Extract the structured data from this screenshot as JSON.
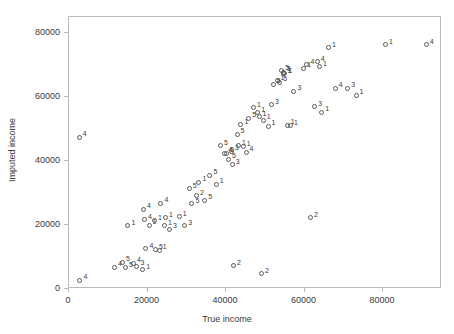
{
  "chart_data": {
    "type": "scatter",
    "title": "",
    "xlabel": "True income",
    "ylabel": "Imputed income",
    "xlim": [
      0,
      95000
    ],
    "ylim": [
      0,
      85000
    ],
    "xticks": [
      0,
      20000,
      40000,
      60000,
      80000
    ],
    "xtick_labels": [
      "0",
      "20000",
      "40000",
      "60000",
      "80000"
    ],
    "yticks": [
      0,
      20000,
      40000,
      60000,
      80000
    ],
    "ytick_labels": [
      "0",
      "20000",
      "40000",
      "60000",
      "80000"
    ],
    "grid": false,
    "legend": false,
    "marker": "open-circle",
    "point_label_note": "each point is annotated with an imputation/group number",
    "points": [
      {
        "x": 2600,
        "y": 47500,
        "label": "4"
      },
      {
        "x": 2800,
        "y": 2700,
        "label": "4"
      },
      {
        "x": 11600,
        "y": 6800,
        "label": "4"
      },
      {
        "x": 13600,
        "y": 8300,
        "label": "5"
      },
      {
        "x": 14400,
        "y": 6600,
        "label": "5"
      },
      {
        "x": 15000,
        "y": 19800,
        "label": "1"
      },
      {
        "x": 16400,
        "y": 8000,
        "label": "4"
      },
      {
        "x": 17300,
        "y": 7100,
        "label": "3"
      },
      {
        "x": 18800,
        "y": 6000,
        "label": "1"
      },
      {
        "x": 19000,
        "y": 25000,
        "label": "4"
      },
      {
        "x": 19200,
        "y": 21700,
        "label": "4"
      },
      {
        "x": 19600,
        "y": 12600,
        "label": "4"
      },
      {
        "x": 20400,
        "y": 19900,
        "label": "1"
      },
      {
        "x": 21800,
        "y": 21400,
        "label": "1"
      },
      {
        "x": 22000,
        "y": 12200,
        "label": "5"
      },
      {
        "x": 23000,
        "y": 12100,
        "label": "1"
      },
      {
        "x": 23400,
        "y": 26800,
        "label": "4"
      },
      {
        "x": 24300,
        "y": 19800,
        "label": "1"
      },
      {
        "x": 24600,
        "y": 22200,
        "label": "1"
      },
      {
        "x": 25600,
        "y": 18600,
        "label": "3"
      },
      {
        "x": 28100,
        "y": 22600,
        "label": "1"
      },
      {
        "x": 29500,
        "y": 19700,
        "label": "3"
      },
      {
        "x": 30600,
        "y": 31300,
        "label": "5"
      },
      {
        "x": 31300,
        "y": 26700,
        "label": "5"
      },
      {
        "x": 32500,
        "y": 29100,
        "label": "2"
      },
      {
        "x": 33100,
        "y": 33300,
        "label": "1"
      },
      {
        "x": 34600,
        "y": 27800,
        "label": "5"
      },
      {
        "x": 35900,
        "y": 35600,
        "label": "5"
      },
      {
        "x": 37500,
        "y": 32800,
        "label": "1"
      },
      {
        "x": 38600,
        "y": 44800,
        "label": "5"
      },
      {
        "x": 39700,
        "y": 42500,
        "label": "4"
      },
      {
        "x": 40200,
        "y": 42500,
        "label": "5"
      },
      {
        "x": 40600,
        "y": 40500,
        "label": "5"
      },
      {
        "x": 41300,
        "y": 43000,
        "label": "3"
      },
      {
        "x": 41600,
        "y": 38900,
        "label": "3"
      },
      {
        "x": 41900,
        "y": 7300,
        "label": "2"
      },
      {
        "x": 42800,
        "y": 48400,
        "label": "5"
      },
      {
        "x": 43200,
        "y": 44700,
        "label": "1"
      },
      {
        "x": 43800,
        "y": 51400,
        "label": "1"
      },
      {
        "x": 44400,
        "y": 44500,
        "label": "1"
      },
      {
        "x": 45100,
        "y": 42800,
        "label": "4"
      },
      {
        "x": 45800,
        "y": 53400,
        "label": "5"
      },
      {
        "x": 47000,
        "y": 56600,
        "label": "1"
      },
      {
        "x": 48100,
        "y": 55100,
        "label": "1"
      },
      {
        "x": 48400,
        "y": 53800,
        "label": "1"
      },
      {
        "x": 49000,
        "y": 4800,
        "label": "2"
      },
      {
        "x": 49500,
        "y": 52700,
        "label": "1"
      },
      {
        "x": 50700,
        "y": 50800,
        "label": "1"
      },
      {
        "x": 51600,
        "y": 57600,
        "label": "3"
      },
      {
        "x": 52000,
        "y": 64000,
        "label": "5"
      },
      {
        "x": 53000,
        "y": 65100,
        "label": "1"
      },
      {
        "x": 53700,
        "y": 64600,
        "label": "5"
      },
      {
        "x": 54200,
        "y": 68200,
        "label": "5"
      },
      {
        "x": 54600,
        "y": 67700,
        "label": "5"
      },
      {
        "x": 54700,
        "y": 67300,
        "label": "1"
      },
      {
        "x": 55000,
        "y": 67200,
        "label": "1"
      },
      {
        "x": 55600,
        "y": 51200,
        "label": "1"
      },
      {
        "x": 56400,
        "y": 51000,
        "label": "1"
      },
      {
        "x": 57300,
        "y": 61800,
        "label": "3"
      },
      {
        "x": 59800,
        "y": 69000,
        "label": "1"
      },
      {
        "x": 60600,
        "y": 70100,
        "label": "4"
      },
      {
        "x": 61500,
        "y": 22300,
        "label": "2"
      },
      {
        "x": 62600,
        "y": 57000,
        "label": "3"
      },
      {
        "x": 63200,
        "y": 71000,
        "label": "4"
      },
      {
        "x": 63800,
        "y": 69500,
        "label": "1"
      },
      {
        "x": 64400,
        "y": 55300,
        "label": "1"
      },
      {
        "x": 66100,
        "y": 75400,
        "label": "1"
      },
      {
        "x": 67800,
        "y": 62800,
        "label": "4"
      },
      {
        "x": 71000,
        "y": 62800,
        "label": "3"
      },
      {
        "x": 73100,
        "y": 60600,
        "label": "1"
      },
      {
        "x": 80600,
        "y": 76300,
        "label": "1"
      },
      {
        "x": 91000,
        "y": 76300,
        "label": "4"
      }
    ]
  },
  "figure": {
    "x_axis_title": "True income",
    "y_axis_title": "Imputed income"
  }
}
